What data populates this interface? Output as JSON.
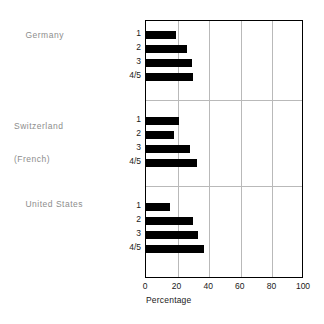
{
  "chart_data": {
    "type": "bar",
    "orientation": "horizontal",
    "title": "",
    "xlabel": "Percentage",
    "ylabel": "",
    "xlim": [
      0,
      100
    ],
    "xticks": [
      0,
      20,
      40,
      60,
      80,
      100
    ],
    "grid": "vertical",
    "legend": "none",
    "categories": [
      "1",
      "2",
      "3",
      "4/5"
    ],
    "groups": [
      {
        "name": "Germany",
        "values": [
          19,
          26,
          29,
          30
        ]
      },
      {
        "name": "Switzerland (French)",
        "values": [
          21,
          18,
          28,
          32
        ]
      },
      {
        "name": "United States",
        "values": [
          15,
          30,
          33,
          37
        ]
      }
    ],
    "bar_color": "#000000",
    "grid_color": "#b9b9b9",
    "frame_color": "#000000"
  },
  "axis": {
    "x_label": "Percentage",
    "ticks": [
      "0",
      "20",
      "40",
      "60",
      "80",
      "100"
    ]
  },
  "groups": [
    {
      "label_line1": "Germany",
      "label_line2": ""
    },
    {
      "label_line1": "Switzerland",
      "label_line2": "(French)"
    },
    {
      "label_line1": "United States",
      "label_line2": ""
    }
  ],
  "categories": [
    "1",
    "2",
    "3",
    "4/5"
  ]
}
